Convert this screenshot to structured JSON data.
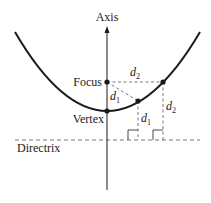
{
  "diagram": {
    "labels": {
      "axis": "Axis",
      "focus": "Focus",
      "vertex": "Vertex",
      "directrix": "Directrix",
      "d_symbol": "d",
      "sub1": "1",
      "sub2": "2"
    },
    "colors": {
      "stroke": "#1a1a1a",
      "dashed": "#555555",
      "background": "#ffffff"
    },
    "points": {
      "focus": [
        107,
        82
      ],
      "vertex": [
        107,
        111
      ],
      "p1": [
        138,
        101
      ],
      "p2": [
        163,
        82
      ]
    },
    "directrix_y": 140,
    "axis_x": 107
  }
}
